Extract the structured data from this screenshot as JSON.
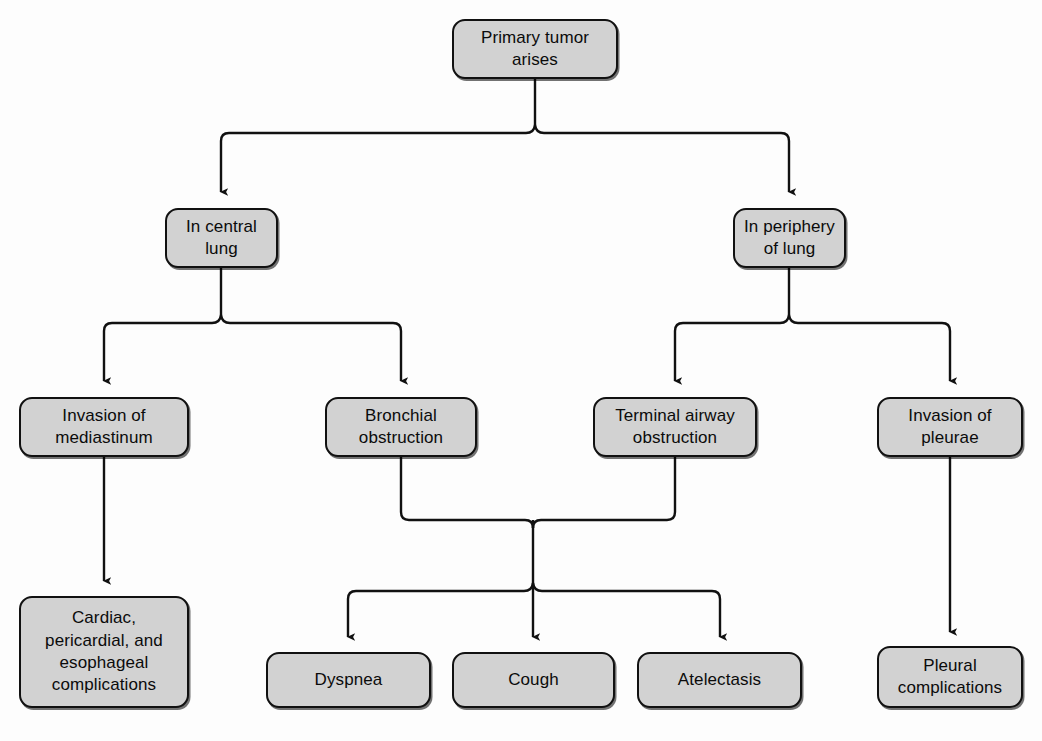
{
  "diagram": {
    "background_color": "#fdfdfd",
    "node_fill_color": "#d2d2d2",
    "node_border_color": "#111111",
    "connector_color": "#111111",
    "nodes": {
      "root": {
        "label": "Primary tumor\narises"
      },
      "central": {
        "label": "In central lung"
      },
      "periphery": {
        "label": "In periphery\nof lung"
      },
      "mediastinum": {
        "label": "Invasion of\nmediastinum"
      },
      "bronchial": {
        "label": "Bronchial\nobstruction"
      },
      "terminal": {
        "label": "Terminal airway\nobstruction"
      },
      "pleurae": {
        "label": "Invasion of\npleurae"
      },
      "cardiac": {
        "label": "Cardiac,\npericardial, and\nesophageal\ncomplications"
      },
      "dyspnea": {
        "label": "Dyspnea"
      },
      "cough": {
        "label": "Cough"
      },
      "atelectasis": {
        "label": "Atelectasis"
      },
      "pleural_comp": {
        "label": "Pleural\ncomplications"
      }
    },
    "edges": [
      {
        "from": "root",
        "to": "central"
      },
      {
        "from": "root",
        "to": "periphery"
      },
      {
        "from": "central",
        "to": "mediastinum"
      },
      {
        "from": "central",
        "to": "bronchial"
      },
      {
        "from": "periphery",
        "to": "terminal"
      },
      {
        "from": "periphery",
        "to": "pleurae"
      },
      {
        "from": "mediastinum",
        "to": "cardiac"
      },
      {
        "from": "bronchial",
        "to": "dyspnea"
      },
      {
        "from": "bronchial",
        "to": "cough"
      },
      {
        "from": "bronchial",
        "to": "atelectasis"
      },
      {
        "from": "terminal",
        "to": "dyspnea"
      },
      {
        "from": "terminal",
        "to": "cough"
      },
      {
        "from": "terminal",
        "to": "atelectasis"
      },
      {
        "from": "pleurae",
        "to": "pleural_comp"
      }
    ]
  }
}
